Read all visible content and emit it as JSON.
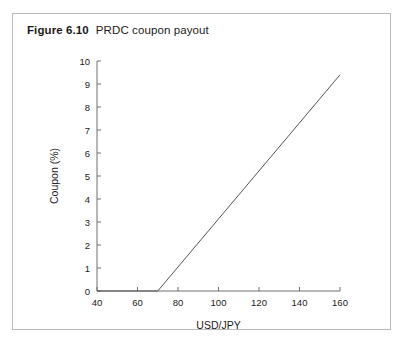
{
  "figure": {
    "label": "Figure 6.10",
    "caption": "PRDC coupon payout"
  },
  "chart_data": {
    "type": "line",
    "title": "PRDC coupon payout",
    "xlabel": "USD/JPY",
    "ylabel": "Coupon (%)",
    "xlim": [
      40,
      160
    ],
    "ylim": [
      0,
      10
    ],
    "xticks": [
      40,
      60,
      80,
      100,
      120,
      140,
      160
    ],
    "yticks": [
      0,
      1,
      2,
      3,
      4,
      5,
      6,
      7,
      8,
      9,
      10
    ],
    "xtick_labels": [
      "40",
      "60",
      "80",
      "100",
      "120",
      "140",
      "160"
    ],
    "ytick_labels": [
      "0",
      "1",
      "2",
      "3",
      "4",
      "5",
      "6",
      "7",
      "8",
      "9",
      "10"
    ],
    "grid": false,
    "legend": false,
    "line_color": "#555555",
    "series": [
      {
        "name": "PRDC coupon",
        "x": [
          40,
          70,
          160
        ],
        "values": [
          0,
          0,
          9.4
        ]
      }
    ]
  }
}
